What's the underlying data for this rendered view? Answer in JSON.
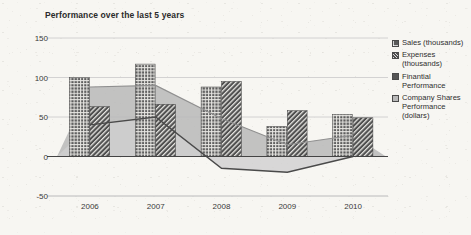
{
  "chart_data": {
    "type": "bar",
    "title": "Performance over the last 5 years",
    "xlabel": "",
    "ylabel": "",
    "ylim": [
      -50,
      150
    ],
    "yticks": [
      150,
      100,
      50,
      0,
      -50
    ],
    "grid": true,
    "legend_position": "right",
    "categories": [
      "2006",
      "2007",
      "2008",
      "2009",
      "2010"
    ],
    "series": [
      {
        "name": "Sales (thousands)",
        "kind": "bar",
        "values": [
          100,
          117,
          88,
          38,
          53
        ],
        "color": "#5a5a5a",
        "pattern": "grid"
      },
      {
        "name": "Expenses (thousands)",
        "kind": "bar",
        "values": [
          63,
          66,
          95,
          58,
          49
        ],
        "color": "#4f4f4f",
        "pattern": "diagonal"
      },
      {
        "name": "Finantial Performance",
        "kind": "line",
        "values": [
          40,
          50,
          -15,
          -20,
          0
        ],
        "color": "#555555",
        "pattern": "solid"
      },
      {
        "name": "Company Shares Performance (dollars)",
        "kind": "area",
        "values": [
          88,
          90,
          48,
          15,
          27
        ],
        "color": "#b9b9b9",
        "pattern": "solid"
      }
    ]
  },
  "legend": {
    "items": [
      {
        "swatch": "sales-swatch",
        "label": "Sales (thousands)"
      },
      {
        "swatch": "expenses-swatch",
        "label": "Expenses (thousands)"
      },
      {
        "swatch": "financial-swatch",
        "label": "Finantial Performance"
      },
      {
        "swatch": "shares-swatch",
        "label": "Company Shares Performance (dollars)"
      }
    ]
  },
  "axis": {
    "y_labels": [
      "150",
      "100",
      "50",
      "0",
      "-50"
    ],
    "x_labels": [
      "2006",
      "2007",
      "2008",
      "2009",
      "2010"
    ]
  },
  "colors": {
    "background": "#f7f6f2",
    "text": "#2b2b2b",
    "grid": "#c9c9c9",
    "axis": "#555555"
  }
}
